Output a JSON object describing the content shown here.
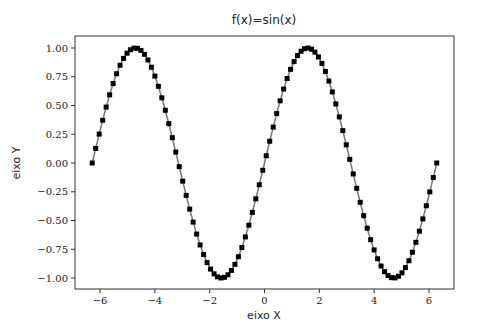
{
  "chart_data": {
    "type": "line",
    "title": "f(x)=sin(x)",
    "xlabel": "eixo X",
    "ylabel": "eixo Y",
    "function": "sin(x)",
    "x_range": [
      -6.283185,
      6.283185
    ],
    "num_points": 100,
    "xlim": [
      -6.9,
      6.9
    ],
    "ylim": [
      -1.1,
      1.1
    ],
    "xticks": [
      -6,
      -4,
      -2,
      0,
      2,
      4,
      6
    ],
    "xtick_labels": [
      "−6",
      "−4",
      "−2",
      "0",
      "2",
      "4",
      "6"
    ],
    "yticks": [
      1.0,
      0.75,
      0.5,
      0.25,
      0.0,
      -0.25,
      -0.5,
      -0.75,
      -1.0
    ],
    "ytick_labels": [
      "1.00",
      "0.75",
      "0.50",
      "0.25",
      "0.00",
      "−0.25",
      "−0.50",
      "−0.75",
      "−1.00"
    ],
    "grid": false,
    "legend": null,
    "series": [
      {
        "name": "sin(x)",
        "marker": "square",
        "marker_color": "#000000",
        "line_color": "#777777",
        "x_start": -6.283185,
        "x_end": 6.283185,
        "count": 100
      }
    ]
  },
  "colors": {
    "frame": "#333333",
    "marker": "#000000",
    "line": "#777777",
    "background": "#ffffff"
  }
}
